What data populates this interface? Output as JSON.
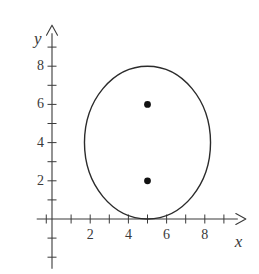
{
  "figure": {
    "background_color": "#ffffff",
    "ink_color": "#3a3a3a",
    "curve_color": "#2b2b2b",
    "point_color": "#111111"
  },
  "axes": {
    "x_axis_label": "x",
    "y_axis_label": "y",
    "origin_px": {
      "x": 52,
      "y": 219
    },
    "unit_px": 19.1,
    "x_range": [
      -0.8,
      10.2
    ],
    "y_range": [
      -2.6,
      10.2
    ],
    "x_tick_values": [
      1,
      2,
      3,
      4,
      5,
      6,
      7,
      8,
      9
    ],
    "y_tick_values": [
      1,
      2,
      3,
      4,
      5,
      6,
      7,
      8,
      9
    ],
    "x_tick_labels": [
      {
        "value": 2,
        "text": "2"
      },
      {
        "value": 4,
        "text": "4"
      },
      {
        "value": 6,
        "text": "6"
      },
      {
        "value": 8,
        "text": "8"
      }
    ],
    "y_tick_labels": [
      {
        "value": 2,
        "text": "2"
      },
      {
        "value": 4,
        "text": "4"
      },
      {
        "value": 6,
        "text": "6"
      },
      {
        "value": 8,
        "text": "8"
      }
    ],
    "grid": false,
    "arrowheads": [
      "x-positive",
      "y-positive"
    ]
  },
  "chart_data": {
    "type": "scatter",
    "title": "",
    "xlabel": "x",
    "ylabel": "y",
    "xlim": [
      -0.8,
      10.2
    ],
    "ylim": [
      -2.6,
      10.2
    ],
    "grid": false,
    "legend": null,
    "curves": [
      {
        "name": "oval",
        "kind": "closed-curve-ellipse",
        "center": [
          5.0,
          4.0
        ],
        "semi_axis_x": 3.3,
        "semi_axis_y": 4.0,
        "x_extent": [
          1.7,
          8.3
        ],
        "y_extent": [
          0.0,
          8.0
        ],
        "stroke": "#2b2b2b",
        "stroke_width": 1.4,
        "fill": "none"
      }
    ],
    "points": [
      {
        "label": "",
        "x": 5,
        "y": 6,
        "marker": "filled-circle",
        "color": "#111111"
      },
      {
        "label": "",
        "x": 5,
        "y": 2,
        "marker": "filled-circle",
        "color": "#111111"
      }
    ],
    "annotations": []
  }
}
